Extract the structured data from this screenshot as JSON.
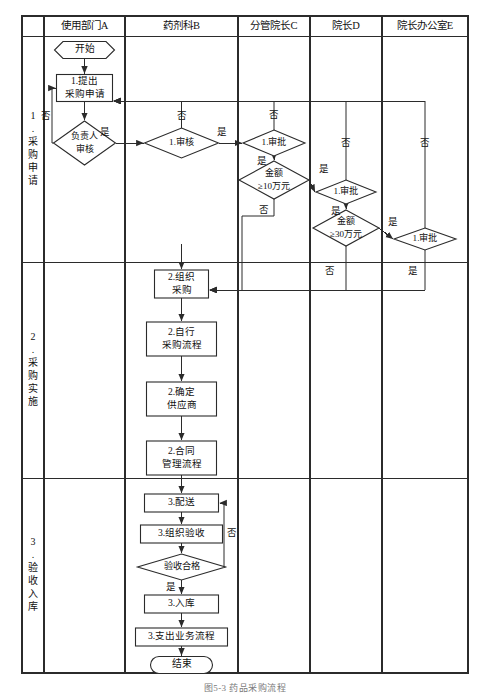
{
  "diagram": {
    "title_caption": "图5-3 药品采购流程",
    "lane_headers": [
      {
        "id": "stage",
        "label": ""
      },
      {
        "id": "A",
        "label": "使用部门A"
      },
      {
        "id": "B",
        "label": "药剂科B"
      },
      {
        "id": "C",
        "label": "分管院长C"
      },
      {
        "id": "D",
        "label": "院长D"
      },
      {
        "id": "E",
        "label": "院长办公室E"
      }
    ],
    "stages": [
      {
        "id": "s1",
        "label": "1.采购申请"
      },
      {
        "id": "s2",
        "label": "2.采购实施"
      },
      {
        "id": "s3",
        "label": "3.验收入库"
      }
    ],
    "nodes": [
      {
        "id": "n_start",
        "type": "hexagon",
        "lane": "A",
        "stage": "s1",
        "label": "开始"
      },
      {
        "id": "n_apply",
        "type": "process",
        "lane": "A",
        "stage": "s1",
        "label": "1.提出\n采购申请",
        "line1": "1.提出",
        "line2": "采购申请"
      },
      {
        "id": "n_owner",
        "type": "decision",
        "lane": "A",
        "stage": "s1",
        "label": "负责人\n审核",
        "line1": "负责人",
        "line2": "审核"
      },
      {
        "id": "n_review",
        "type": "decision",
        "lane": "B",
        "stage": "s1",
        "label": "1.审核",
        "line1": "1.审核",
        "line2": ""
      },
      {
        "id": "n_approve_c",
        "type": "decision",
        "lane": "C",
        "stage": "s1",
        "label": "1.审批",
        "line1": "1.审批",
        "line2": ""
      },
      {
        "id": "n_amount10",
        "type": "decision",
        "lane": "C",
        "stage": "s1",
        "label": "金额\n≥10万元",
        "line1": "金额",
        "line2": "≥10万元"
      },
      {
        "id": "n_approve_d",
        "type": "decision",
        "lane": "D",
        "stage": "s1",
        "label": "1.审批",
        "line1": "1.审批",
        "line2": ""
      },
      {
        "id": "n_amount30",
        "type": "decision",
        "lane": "D",
        "stage": "s1",
        "label": "金额\n≥30万元",
        "line1": "金额",
        "line2": "≥30万元"
      },
      {
        "id": "n_approve_e",
        "type": "decision",
        "lane": "E",
        "stage": "s1",
        "label": "1.审批",
        "line1": "1.审批",
        "line2": ""
      },
      {
        "id": "n_org_buy",
        "type": "process",
        "lane": "B",
        "stage": "s2",
        "label": "2.组织\n采购",
        "line1": "2.组织",
        "line2": "采购"
      },
      {
        "id": "n_self_buy",
        "type": "process",
        "lane": "B",
        "stage": "s2",
        "label": "2.自行\n采购流程",
        "line1": "2.自行",
        "line2": "采购流程"
      },
      {
        "id": "n_supplier",
        "type": "process",
        "lane": "B",
        "stage": "s2",
        "label": "2.确定\n供应商",
        "line1": "2.确定",
        "line2": "供应商"
      },
      {
        "id": "n_contract",
        "type": "process",
        "lane": "B",
        "stage": "s2",
        "label": "2.合同\n管理流程",
        "line1": "2.合同",
        "line2": "管理流程"
      },
      {
        "id": "n_deliver",
        "type": "process",
        "lane": "B",
        "stage": "s3",
        "label": "3.配送",
        "line1": "3.配送",
        "line2": ""
      },
      {
        "id": "n_accept_org",
        "type": "process",
        "lane": "B",
        "stage": "s3",
        "label": "3.组织验收",
        "line1": "3.组织验收",
        "line2": ""
      },
      {
        "id": "n_accept_ok",
        "type": "decision",
        "lane": "B",
        "stage": "s3",
        "label": "验收合格",
        "line1": "验收合格",
        "line2": ""
      },
      {
        "id": "n_stock",
        "type": "process",
        "lane": "B",
        "stage": "s3",
        "label": "3.入库",
        "line1": "3.入库",
        "line2": ""
      },
      {
        "id": "n_expense",
        "type": "process",
        "lane": "B",
        "stage": "s3",
        "label": "3.支出业务流程",
        "line1": "3.支出业务流程",
        "line2": ""
      },
      {
        "id": "n_end",
        "type": "terminator",
        "lane": "B",
        "stage": "s3",
        "label": "结束"
      }
    ],
    "edge_labels": [
      {
        "id": "e1",
        "text": "否",
        "note": "负责人审核 reject loop back to 1.提出采购申请"
      },
      {
        "id": "e2",
        "text": "是",
        "note": "负责人审核 pass to 1.审核"
      },
      {
        "id": "e3",
        "text": "否",
        "note": "1.审核 reject back to 1.提出采购申请"
      },
      {
        "id": "e4",
        "text": "是",
        "note": "1.审核 pass to 1.审批 (分管院长C)"
      },
      {
        "id": "e5",
        "text": "否",
        "note": "1.审批 C reject back to 1.提出采购申请"
      },
      {
        "id": "e6",
        "text": "是",
        "note": "1.审批 C pass to 金额≥10万元"
      },
      {
        "id": "e7",
        "text": "否",
        "note": "金额≥10万元 no -> 2.组织采购"
      },
      {
        "id": "e8",
        "text": "是",
        "note": "金额≥10万元 yes -> 1.审批 (院长D)"
      },
      {
        "id": "e9",
        "text": "否",
        "note": "1.审批 D reject back to 1.提出采购申请"
      },
      {
        "id": "e10",
        "text": "是",
        "note": "1.审批 D pass to 金额≥30万元"
      },
      {
        "id": "e11",
        "text": "否",
        "note": "金额≥30万元 no -> 2.组织采购"
      },
      {
        "id": "e12",
        "text": "是",
        "note": "金额≥30万元 yes -> 1.审批 (院长办公室E)"
      },
      {
        "id": "e13",
        "text": "否",
        "note": "1.审批 E reject back to 1.提出采购申请"
      },
      {
        "id": "e14",
        "text": "是",
        "note": "1.审批 E pass -> 2.组织采购"
      },
      {
        "id": "e15",
        "text": "否",
        "note": "验收合格 no -> back to 3.配送"
      },
      {
        "id": "e16",
        "text": "是",
        "note": "验收合格 yes -> 3.入库"
      }
    ],
    "colors": {
      "line": "#2b2b2b",
      "text": "#111111",
      "background": "#ffffff",
      "caption": "#7a7a7a"
    }
  }
}
